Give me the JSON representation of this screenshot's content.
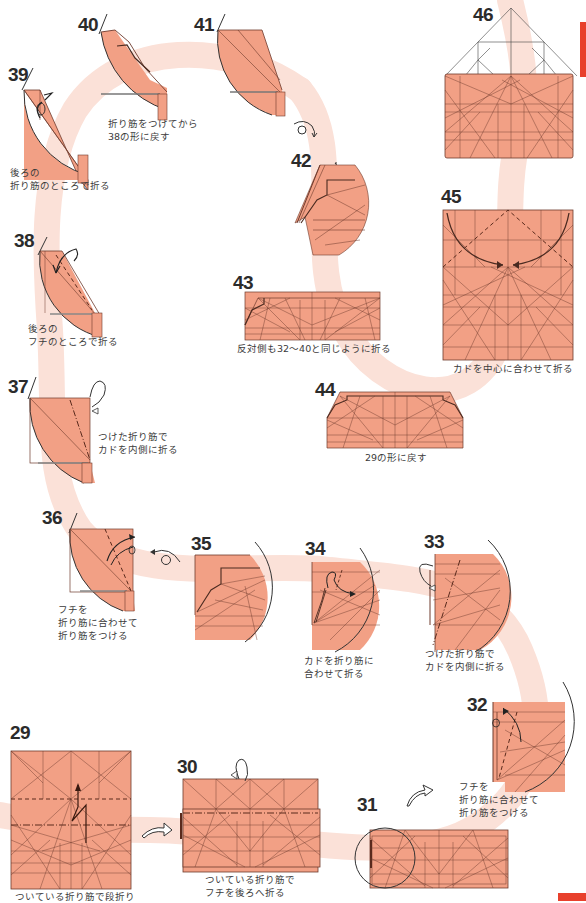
{
  "page": {
    "type": "origami instruction diagram",
    "colors": {
      "paper": "#f2a085",
      "paper_light": "#f6b9a2",
      "crease": "#6e3a2c",
      "path_band": "#fbe3db",
      "accent_edge": "#e8402c",
      "text": "#3b3b3b"
    }
  },
  "steps": [
    {
      "id": "29",
      "number": "29",
      "caption_lines": [
        "ついている折り筋で段折り"
      ],
      "icon": "pleat-fold-arrow-icon"
    },
    {
      "id": "30",
      "number": "30",
      "caption_lines": [
        "ついている折り筋で",
        "フチを後ろへ折る"
      ],
      "icon": "fold-behind-arrow-icon"
    },
    {
      "id": "31",
      "number": "31",
      "caption_lines": [],
      "icon": "zoom-circle-icon"
    },
    {
      "id": "32",
      "number": "32",
      "caption_lines": [
        "フチを",
        "折り筋に合わせて",
        "折り筋をつける"
      ],
      "icon": "fold-unfold-arrow-icon"
    },
    {
      "id": "33",
      "number": "33",
      "caption_lines": [
        "つけた折り筋で",
        "カドを内側に折る"
      ],
      "icon": "inside-reverse-fold-icon"
    },
    {
      "id": "34",
      "number": "34",
      "caption_lines": [
        "カドを折り筋に",
        "合わせて折る"
      ],
      "icon": "fold-arrow-icon"
    },
    {
      "id": "35",
      "number": "35",
      "caption_lines": [],
      "icon": "turn-over-icon"
    },
    {
      "id": "36",
      "number": "36",
      "caption_lines": [
        "フチを",
        "折り筋に合わせて",
        "折り筋をつける"
      ],
      "icon": "fold-unfold-arrow-icon"
    },
    {
      "id": "37",
      "number": "37",
      "caption_lines": [
        "つけた折り筋で",
        "カドを内側に折る"
      ],
      "icon": "inside-reverse-fold-icon"
    },
    {
      "id": "38",
      "number": "38",
      "caption_lines": [
        "後ろの",
        "フチのところで折る"
      ],
      "icon": "fold-arrow-icon"
    },
    {
      "id": "39",
      "number": "39",
      "caption_lines": [
        "後ろの",
        "折り筋のところで折る"
      ],
      "icon": "fold-arrow-icon"
    },
    {
      "id": "40",
      "number": "40",
      "caption_lines": [
        "折り筋をつけてから",
        "38の形に戻す"
      ],
      "icon": null
    },
    {
      "id": "41",
      "number": "41",
      "caption_lines": [],
      "icon": "turn-over-icon"
    },
    {
      "id": "42",
      "number": "42",
      "caption_lines": [],
      "icon": null
    },
    {
      "id": "43",
      "number": "43",
      "caption_lines": [
        "反対側も32～40と同じように折る"
      ],
      "icon": null
    },
    {
      "id": "44",
      "number": "44",
      "caption_lines": [
        "29の形に戻す"
      ],
      "icon": null
    },
    {
      "id": "45",
      "number": "45",
      "caption_lines": [
        "カドを中心に合わせて折る"
      ],
      "icon": "fold-arrow-icon"
    },
    {
      "id": "46",
      "number": "46",
      "caption_lines": [],
      "icon": null
    }
  ],
  "labels": {
    "s29": {
      "num": "29",
      "c1": "ついている折り筋で段折り"
    },
    "s30": {
      "num": "30",
      "c1": "ついている折り筋で",
      "c2": "フチを後ろへ折る"
    },
    "s31": {
      "num": "31"
    },
    "s32": {
      "num": "32",
      "c1": "フチを",
      "c2": "折り筋に合わせて",
      "c3": "折り筋をつける"
    },
    "s33": {
      "num": "33",
      "c1": "つけた折り筋で",
      "c2": "カドを内側に折る"
    },
    "s34": {
      "num": "34",
      "c1": "カドを折り筋に",
      "c2": "合わせて折る"
    },
    "s35": {
      "num": "35"
    },
    "s36": {
      "num": "36",
      "c1": "フチを",
      "c2": "折り筋に合わせて",
      "c3": "折り筋をつける"
    },
    "s37": {
      "num": "37",
      "c1": "つけた折り筋で",
      "c2": "カドを内側に折る"
    },
    "s38": {
      "num": "38",
      "c1": "後ろの",
      "c2": "フチのところで折る"
    },
    "s39": {
      "num": "39",
      "c1": "後ろの",
      "c2": "折り筋のところで折る"
    },
    "s40": {
      "num": "40",
      "c1": "折り筋をつけてから",
      "c2": "38の形に戻す"
    },
    "s41": {
      "num": "41"
    },
    "s42": {
      "num": "42"
    },
    "s43": {
      "num": "43",
      "c1": "反対側も32～40と同じように折る"
    },
    "s44": {
      "num": "44",
      "c1": "29の形に戻す"
    },
    "s45": {
      "num": "45",
      "c1": "カドを中心に合わせて折る"
    },
    "s46": {
      "num": "46"
    }
  }
}
